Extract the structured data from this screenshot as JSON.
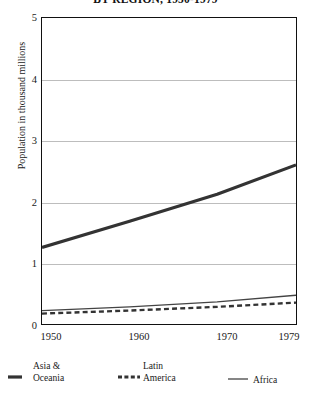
{
  "title": "BY REGION, 1950-1979",
  "axis": {
    "y_label": "Population in thousand millions",
    "y_ticks": [
      "0",
      "1",
      "2",
      "3",
      "4",
      "5"
    ],
    "x_ticks": [
      "1950",
      "1960",
      "1970",
      "1979"
    ]
  },
  "legend": {
    "asia_top": "Asia  &",
    "asia_bottom": "Oceania",
    "latin_top": "Latin",
    "latin_bottom": "America",
    "africa": "Africa"
  },
  "colors": {
    "frame": "#111111",
    "grid": "#bdbdbd",
    "asia": "#333333",
    "latin": "#333333",
    "africa": "#444444"
  },
  "chart_data": {
    "type": "line",
    "title": "BY REGION, 1950-1979",
    "xlabel": "",
    "ylabel": "Population in thousand millions",
    "xlim": [
      1950,
      1979
    ],
    "ylim": [
      0,
      5
    ],
    "grid": true,
    "legend_position": "below",
    "x": [
      1950,
      1960,
      1970,
      1979
    ],
    "series": [
      {
        "name": "Asia & Oceania",
        "style": "thick-solid",
        "values": [
          1.25,
          1.68,
          2.12,
          2.6
        ]
      },
      {
        "name": "Latin America",
        "style": "dashed",
        "values": [
          0.17,
          0.22,
          0.28,
          0.35
        ]
      },
      {
        "name": "Africa",
        "style": "thin-solid",
        "values": [
          0.22,
          0.28,
          0.36,
          0.47
        ]
      }
    ]
  }
}
